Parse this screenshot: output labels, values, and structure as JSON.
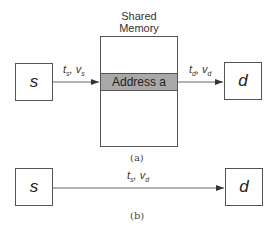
{
  "figure_a": {
    "source_node": {
      "label": "s"
    },
    "dest_node": {
      "label": "d"
    },
    "shared_memory": {
      "title_line1": "Shared",
      "title_line2": "Memory",
      "address_label": "Address a"
    },
    "edge_in": {
      "t": "t",
      "t_sub": "s",
      "sep": ", ",
      "v": "v",
      "v_sub": "s"
    },
    "edge_out": {
      "t": "t",
      "t_sub": "d",
      "sep": ", ",
      "v": "v",
      "v_sub": "d"
    },
    "caption": "(a)"
  },
  "figure_b": {
    "source_node": {
      "label": "s"
    },
    "dest_node": {
      "label": "d"
    },
    "edge": {
      "t": "t",
      "t_sub": "s",
      "sep": ", ",
      "v": "v",
      "v_sub": "d"
    },
    "caption": "(b)"
  },
  "colors": {
    "line": "#555555",
    "address_fill": "#a8a8a8"
  }
}
